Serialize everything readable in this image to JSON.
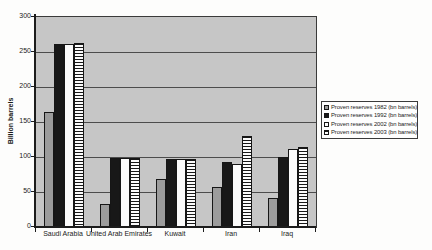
{
  "chart_data": {
    "type": "bar",
    "title": "",
    "xlabel": "",
    "ylabel": "Billion barrels",
    "ylim": [
      0,
      300
    ],
    "ytick_step": 50,
    "grid": true,
    "legend_position": "right",
    "categories": [
      "Saudi Arabia",
      "United Arab Emirates",
      "Kuwait",
      "Iran",
      "Iraq"
    ],
    "series": [
      {
        "name": "Proven reserves 1982 (bn barrels)",
        "style": "gray",
        "values": [
          165,
          33,
          68,
          57,
          41
        ]
      },
      {
        "name": "Proven reserves 1992 (bn barrels)",
        "style": "black",
        "values": [
          261,
          98,
          96.5,
          93,
          100
        ]
      },
      {
        "name": "Proven reserves 2002 (bn barrels)",
        "style": "white",
        "values": [
          262,
          98,
          96.5,
          90,
          112
        ]
      },
      {
        "name": "Proven reserves 2003 (bn barrels)",
        "style": "striped",
        "values": [
          263,
          98,
          96.5,
          130,
          115
        ]
      }
    ],
    "colors": {
      "plot_background": "#c6c6c6",
      "series_gray": "#9c9c9c",
      "series_black": "#181818",
      "series_white": "#fbfbfb",
      "stripe_line": "#181818",
      "axis": "#1c1c1c",
      "text": "#1d1d1d"
    }
  }
}
